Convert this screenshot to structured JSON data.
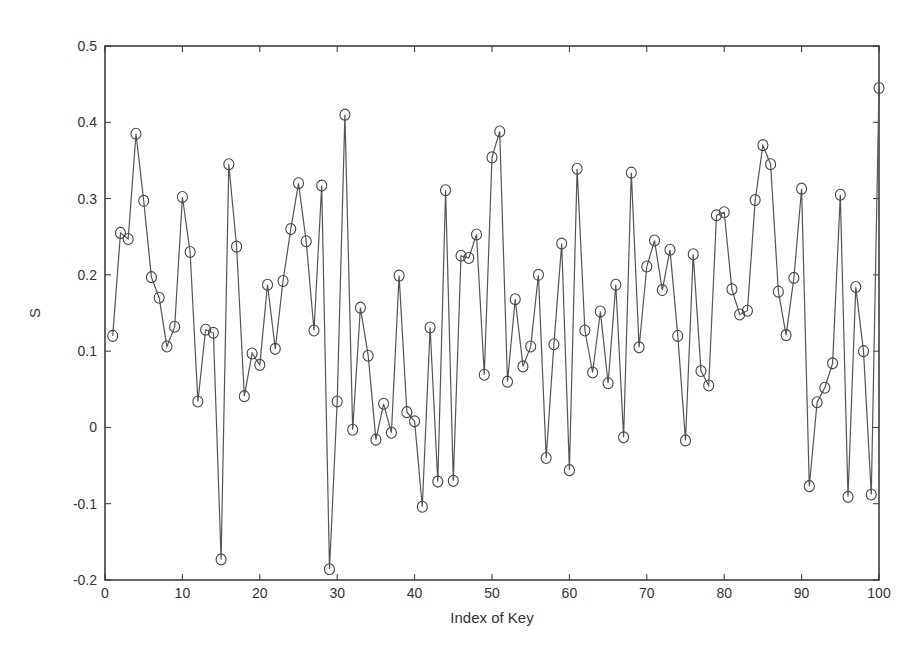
{
  "chart_data": {
    "type": "line",
    "title": "",
    "xlabel": "Index of Key",
    "ylabel": "S",
    "xlim": [
      0,
      100
    ],
    "ylim": [
      -0.2,
      0.5
    ],
    "xticks": [
      0,
      10,
      20,
      30,
      40,
      50,
      60,
      70,
      80,
      90,
      100
    ],
    "yticks": [
      -0.2,
      -0.1,
      0,
      0.1,
      0.2,
      0.3,
      0.4,
      0.5
    ],
    "ytick_labels": [
      "-0.2",
      "-0.1",
      "0",
      "0.1",
      "0.2",
      "0.3",
      "0.4",
      "0.5"
    ],
    "grid": false,
    "legend": null,
    "marker": "circle",
    "line_color": "#555555",
    "series": [
      {
        "name": "S",
        "x": [
          1,
          2,
          3,
          4,
          5,
          6,
          7,
          8,
          9,
          10,
          11,
          12,
          13,
          14,
          15,
          16,
          17,
          18,
          19,
          20,
          21,
          22,
          23,
          24,
          25,
          26,
          27,
          28,
          29,
          30,
          31,
          32,
          33,
          34,
          35,
          36,
          37,
          38,
          39,
          40,
          41,
          42,
          43,
          44,
          45,
          46,
          47,
          48,
          49,
          50,
          51,
          52,
          53,
          54,
          55,
          56,
          57,
          58,
          59,
          60,
          61,
          62,
          63,
          64,
          65,
          66,
          67,
          68,
          69,
          70,
          71,
          72,
          73,
          74,
          75,
          76,
          77,
          78,
          79,
          80,
          81,
          82,
          83,
          84,
          85,
          86,
          87,
          88,
          89,
          90,
          91,
          92,
          93,
          94,
          95,
          96,
          97,
          98,
          99,
          100
        ],
        "values": [
          0.12,
          0.255,
          0.247,
          0.385,
          0.297,
          0.197,
          0.17,
          0.106,
          0.132,
          0.302,
          0.23,
          0.034,
          0.128,
          0.124,
          -0.173,
          0.345,
          0.237,
          0.041,
          0.097,
          0.082,
          0.187,
          0.103,
          0.192,
          0.26,
          0.32,
          0.244,
          0.127,
          0.317,
          -0.186,
          0.034,
          0.41,
          -0.003,
          0.157,
          0.094,
          -0.016,
          0.031,
          -0.007,
          0.199,
          0.02,
          0.008,
          -0.104,
          0.131,
          -0.071,
          0.311,
          -0.07,
          0.225,
          0.222,
          0.253,
          0.069,
          0.354,
          0.388,
          0.06,
          0.168,
          0.08,
          0.106,
          0.2,
          -0.04,
          0.109,
          0.241,
          -0.056,
          0.339,
          0.127,
          0.072,
          0.152,
          0.058,
          0.187,
          -0.013,
          0.334,
          0.105,
          0.211,
          0.245,
          0.18,
          0.233,
          0.12,
          -0.017,
          0.227,
          0.074,
          0.055,
          0.278,
          0.282,
          0.181,
          0.148,
          0.153,
          0.298,
          0.37,
          0.345,
          0.178,
          0.121,
          0.196,
          0.313,
          -0.077,
          0.033,
          0.052,
          0.084,
          0.305,
          -0.091,
          0.184,
          0.1,
          -0.088,
          0.445
        ]
      }
    ]
  }
}
